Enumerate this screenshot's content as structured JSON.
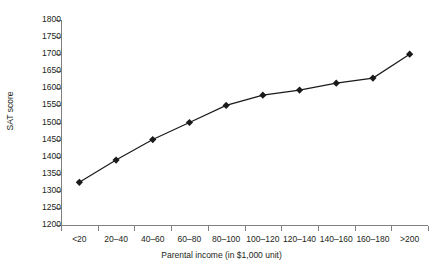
{
  "chart_data": {
    "type": "line",
    "title": "",
    "xlabel": "Parental income (in $1,000 unit)",
    "ylabel": "SAT score",
    "categories": [
      "<20",
      "20–40",
      "40–60",
      "60–80",
      "80–100",
      "100–120",
      "120–140",
      "140–160",
      "160–180",
      ">200"
    ],
    "values": [
      1325,
      1390,
      1450,
      1500,
      1550,
      1580,
      1595,
      1615,
      1630,
      1700
    ],
    "series": [
      {
        "name": "SAT score",
        "values": [
          1325,
          1390,
          1450,
          1500,
          1550,
          1580,
          1595,
          1615,
          1630,
          1700
        ]
      }
    ],
    "ylim": [
      1200,
      1800
    ],
    "ytick_step": 50,
    "yticks": [
      1800,
      1750,
      1700,
      1650,
      1600,
      1550,
      1500,
      1450,
      1400,
      1350,
      1300,
      1250,
      1200
    ],
    "ytick_labels": [
      "1800",
      "1750",
      "1700",
      "1650",
      "1600",
      "1550",
      "1500",
      "1450",
      "1400",
      "1350",
      "1300",
      "1250",
      "1200"
    ],
    "grid": false,
    "legend": "none",
    "marker": "diamond",
    "line_color": "#1a1a1a",
    "marker_color": "#1a1a1a",
    "axis_color": "#808080"
  }
}
